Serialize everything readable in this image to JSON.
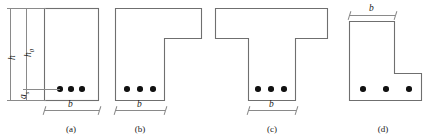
{
  "figure": {
    "type": "engineering-cross-section-diagram",
    "stroke_color": "#6f6f6f",
    "dimension_color": "#8a8a8a",
    "rebar_color": "#111111",
    "background": "#ffffff"
  },
  "sections": [
    {
      "id": "a",
      "caption": "(a)",
      "shape": "rectangle",
      "rebar_count": 3,
      "dimensions": [
        {
          "name": "h",
          "label": "h",
          "subscript": "",
          "orientation": "vertical"
        },
        {
          "name": "h0",
          "label": "h",
          "subscript": "0",
          "orientation": "vertical"
        },
        {
          "name": "as",
          "label": "a",
          "subscript": "s",
          "orientation": "vertical"
        },
        {
          "name": "b",
          "label": "b",
          "subscript": "",
          "orientation": "horizontal"
        }
      ]
    },
    {
      "id": "b",
      "caption": "(b)",
      "shape": "inverted-L-flange-right",
      "rebar_count": 3,
      "dimensions": [
        {
          "name": "b",
          "label": "b",
          "subscript": "",
          "orientation": "horizontal"
        }
      ]
    },
    {
      "id": "c",
      "caption": "(c)",
      "shape": "T-beam",
      "rebar_count": 3,
      "dimensions": [
        {
          "name": "b",
          "label": "b",
          "subscript": "",
          "orientation": "horizontal"
        }
      ]
    },
    {
      "id": "d",
      "caption": "(d)",
      "shape": "L-shape-foot-right",
      "rebar_count": 3,
      "dimensions": [
        {
          "name": "b",
          "label": "b",
          "subscript": "",
          "orientation": "horizontal"
        }
      ]
    }
  ],
  "labels": {
    "h": "h",
    "h0_base": "h",
    "h0_sub": "0",
    "as_base": "a",
    "as_sub": "s",
    "b": "b",
    "caption_a": "(a)",
    "caption_b": "(b)",
    "caption_c": "(c)",
    "caption_d": "(d)"
  }
}
